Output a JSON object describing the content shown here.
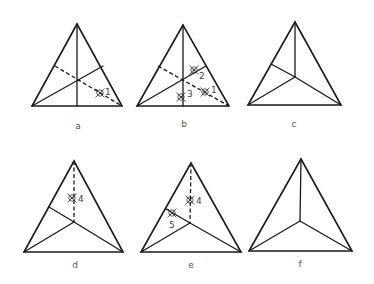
{
  "figure": {
    "panels": [
      {
        "id": "a",
        "label": "a",
        "welds": [
          {
            "number": "1"
          }
        ]
      },
      {
        "id": "b",
        "label": "b",
        "welds": [
          {
            "number": "1"
          },
          {
            "number": "2"
          },
          {
            "number": "3"
          }
        ]
      },
      {
        "id": "c",
        "label": "c",
        "welds": []
      },
      {
        "id": "d",
        "label": "d",
        "welds": [
          {
            "number": "4"
          }
        ]
      },
      {
        "id": "e",
        "label": "e",
        "welds": [
          {
            "number": "4"
          },
          {
            "number": "5"
          }
        ]
      },
      {
        "id": "f",
        "label": "f",
        "welds": []
      }
    ]
  },
  "colors": {
    "line": "#1a1a1a",
    "weld_mark": "#333333",
    "label": "#555555",
    "background": "#ffffff"
  }
}
